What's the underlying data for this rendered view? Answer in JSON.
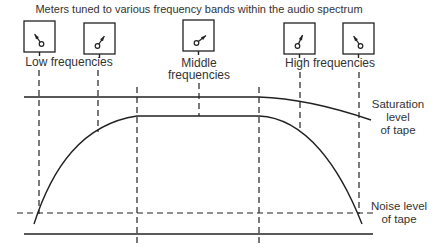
{
  "title": "Meters tuned to various frequency bands within the audio spectrum",
  "labels": {
    "low": "Low frequencies",
    "middle_line1": "Middle",
    "middle_line2": "frequencies",
    "high": "High frequencies"
  },
  "annotations": {
    "saturation_line1": "Saturation",
    "saturation_line2": "level",
    "saturation_line3": "of tape",
    "noise_line1": "Noise level",
    "noise_line2": "of tape"
  },
  "meters": [
    {
      "id": "meter-1",
      "band": "low",
      "x": 24,
      "y": 21,
      "needle_angle_deg": -35
    },
    {
      "id": "meter-2",
      "band": "low",
      "x": 84,
      "y": 23,
      "needle_angle_deg": 35
    },
    {
      "id": "meter-3",
      "band": "middle",
      "x": 183,
      "y": 20,
      "needle_angle_deg": 52
    },
    {
      "id": "meter-4",
      "band": "high",
      "x": 284,
      "y": 23,
      "needle_angle_deg": 25
    },
    {
      "id": "meter-5",
      "band": "high",
      "x": 343,
      "y": 23,
      "needle_angle_deg": -35
    }
  ],
  "colors": {
    "line": "#222222",
    "text": "#333333",
    "background": "#ffffff"
  }
}
